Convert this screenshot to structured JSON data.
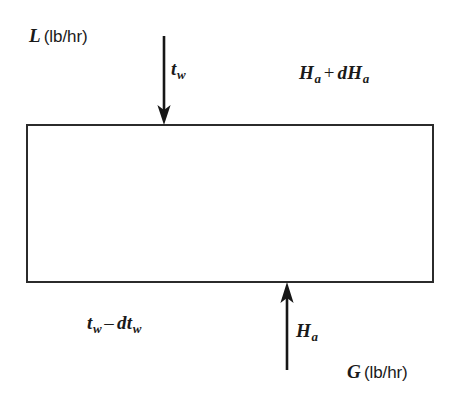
{
  "diagram": {
    "background_color": "#ffffff",
    "stroke_color": "#2b2b2b",
    "text_color": "#1a1a1a",
    "control_volume": {
      "name": "control-volume",
      "x": 26,
      "y": 124,
      "width": 408,
      "height": 159
    },
    "labels": {
      "liquid_flow": {
        "symbol": "L",
        "units": "(lb/hr)"
      },
      "water_temp_in": {
        "symbol": "t",
        "subscript": "w"
      },
      "air_enthalpy_out": {
        "symbol_1": "H",
        "subscript_1": "a",
        "operator": "+",
        "symbol_2": "dH",
        "subscript_2": "a"
      },
      "water_temp_out": {
        "symbol_1": "t",
        "subscript_1": "w",
        "operator": "–",
        "symbol_2": "dt",
        "subscript_2": "w"
      },
      "air_enthalpy_in": {
        "symbol": "H",
        "subscript": "a"
      },
      "gas_flow": {
        "symbol": "G",
        "units": "(lb/hr)"
      }
    },
    "arrows": {
      "water_inlet": {
        "direction": "down",
        "x": 164,
        "y_start": 38,
        "y_end": 124
      },
      "air_inlet": {
        "direction": "up",
        "x": 287,
        "y_start": 370,
        "y_end": 283
      }
    }
  }
}
